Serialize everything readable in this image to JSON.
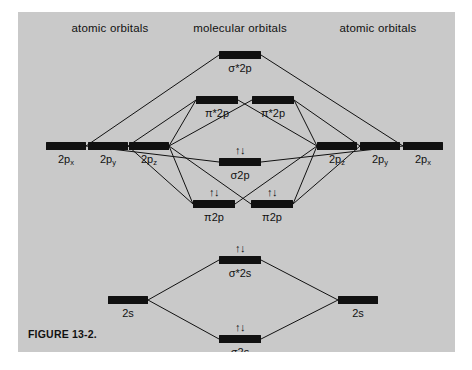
{
  "figure": {
    "caption": "FIGURE 13-2.",
    "caption_x": 10,
    "caption_y": 316,
    "panel_color": "#c9c9c9",
    "ink_color": "#111111"
  },
  "headers": [
    {
      "label": "atomic orbitals",
      "x": 92,
      "y": 10,
      "name": "header-left-atomic-orbitals"
    },
    {
      "label": "molecular orbitals",
      "x": 222,
      "y": 10,
      "name": "header-molecular-orbitals"
    },
    {
      "label": "atomic orbitals",
      "x": 360,
      "y": 10,
      "name": "header-right-atomic-orbitals"
    }
  ],
  "levels": [
    {
      "id": "sigma-star-2p",
      "label": "σ*2p",
      "cx": 222,
      "cy": 43,
      "w": 42,
      "h": 8,
      "electrons": "",
      "label_dy": 7,
      "side": "molecular"
    },
    {
      "id": "pi-star-2p-left",
      "label": "π*2p",
      "cx": 199,
      "cy": 88,
      "w": 42,
      "h": 8,
      "electrons": "",
      "label_dy": 7,
      "side": "molecular"
    },
    {
      "id": "pi-star-2p-right",
      "label": "π*2p",
      "cx": 255,
      "cy": 88,
      "w": 42,
      "h": 8,
      "electrons": "",
      "label_dy": 7,
      "side": "molecular"
    },
    {
      "id": "ao-left-2px",
      "label": "2p",
      "sub": "x",
      "cx": 48,
      "cy": 134,
      "w": 40,
      "h": 8,
      "electrons": "",
      "label_dy": 7,
      "side": "atomic-left"
    },
    {
      "id": "ao-left-2py",
      "label": "2p",
      "sub": "y",
      "cx": 90,
      "cy": 134,
      "w": 40,
      "h": 8,
      "electrons": "",
      "label_dy": 7,
      "side": "atomic-left"
    },
    {
      "id": "ao-left-2pz",
      "label": "2p",
      "sub": "z",
      "cx": 131,
      "cy": 134,
      "w": 40,
      "h": 8,
      "electrons": "",
      "label_dy": 7,
      "side": "atomic-left"
    },
    {
      "id": "sigma-2p",
      "label": "σ2p",
      "cx": 222,
      "cy": 150,
      "w": 42,
      "h": 8,
      "electrons": "↑↓",
      "label_dy": 7,
      "side": "molecular"
    },
    {
      "id": "pi-2p-left",
      "label": "π2p",
      "cx": 196,
      "cy": 192,
      "w": 42,
      "h": 8,
      "electrons": "↑↓",
      "label_dy": 7,
      "side": "molecular"
    },
    {
      "id": "pi-2p-right",
      "label": "π2p",
      "cx": 254,
      "cy": 192,
      "w": 42,
      "h": 8,
      "electrons": "↑↓",
      "label_dy": 7,
      "side": "molecular"
    },
    {
      "id": "ao-right-2pz",
      "label": "2p",
      "sub": "z",
      "cx": 319,
      "cy": 134,
      "w": 40,
      "h": 8,
      "electrons": "",
      "label_dy": 7,
      "side": "atomic-right"
    },
    {
      "id": "ao-right-2py",
      "label": "2p",
      "sub": "y",
      "cx": 362,
      "cy": 134,
      "w": 40,
      "h": 8,
      "electrons": "",
      "label_dy": 7,
      "side": "atomic-right"
    },
    {
      "id": "ao-right-2px",
      "label": "2p",
      "sub": "x",
      "cx": 405,
      "cy": 134,
      "w": 40,
      "h": 8,
      "electrons": "",
      "label_dy": 7,
      "side": "atomic-right"
    },
    {
      "id": "sigma-star-2s",
      "label": "σ*2s",
      "cx": 222,
      "cy": 248,
      "w": 42,
      "h": 8,
      "electrons": "↑↓",
      "label_dy": 7,
      "side": "molecular"
    },
    {
      "id": "ao-left-2s",
      "label": "2s",
      "cx": 110,
      "cy": 288,
      "w": 40,
      "h": 8,
      "electrons": "",
      "label_dy": 7,
      "side": "atomic-left"
    },
    {
      "id": "ao-right-2s",
      "label": "2s",
      "cx": 340,
      "cy": 288,
      "w": 40,
      "h": 8,
      "electrons": "",
      "label_dy": 7,
      "side": "atomic-right"
    },
    {
      "id": "sigma-2s",
      "label": "σ2s",
      "cx": 222,
      "cy": 327,
      "w": 42,
      "h": 8,
      "electrons": "↑↓",
      "label_dy": 7,
      "side": "molecular"
    }
  ],
  "correlation_lines": [
    {
      "from": "ao-left-2px",
      "to": "sigma-star-2p"
    },
    {
      "from": "ao-right-2px",
      "to": "sigma-star-2p"
    },
    {
      "from": "ao-left-2py",
      "to": "pi-star-2p-left"
    },
    {
      "from": "ao-left-2pz",
      "to": "pi-star-2p-left"
    },
    {
      "from": "ao-left-2pz",
      "to": "pi-star-2p-right"
    },
    {
      "from": "ao-right-2py",
      "to": "pi-star-2p-right"
    },
    {
      "from": "ao-right-2pz",
      "to": "pi-star-2p-right"
    },
    {
      "from": "ao-right-2pz",
      "to": "pi-star-2p-left"
    },
    {
      "from": "ao-left-2px",
      "to": "sigma-2p"
    },
    {
      "from": "ao-right-2px",
      "to": "sigma-2p"
    },
    {
      "from": "ao-left-2py",
      "to": "pi-2p-left"
    },
    {
      "from": "ao-left-2pz",
      "to": "pi-2p-left"
    },
    {
      "from": "ao-left-2pz",
      "to": "pi-2p-right"
    },
    {
      "from": "ao-right-2py",
      "to": "pi-2p-right"
    },
    {
      "from": "ao-right-2pz",
      "to": "pi-2p-right"
    },
    {
      "from": "ao-right-2pz",
      "to": "pi-2p-left"
    },
    {
      "from": "ao-left-2s",
      "to": "sigma-star-2s"
    },
    {
      "from": "ao-right-2s",
      "to": "sigma-star-2s"
    },
    {
      "from": "ao-left-2s",
      "to": "sigma-2s"
    },
    {
      "from": "ao-right-2s",
      "to": "sigma-2s"
    }
  ]
}
